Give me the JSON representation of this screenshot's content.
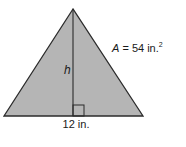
{
  "figure": {
    "shape": "triangle",
    "fill_color": "#b5b5b5",
    "stroke_color": "#2b2b2b",
    "labels": {
      "area_var": "A",
      "area_rest": " = 54 in.",
      "area_exp": "2",
      "height": "h",
      "base": "12 in."
    },
    "values": {
      "area": 54,
      "area_unit": "in.²",
      "base": 12,
      "base_unit": "in.",
      "height": "h"
    },
    "marks": [
      "right-angle-marker"
    ]
  }
}
